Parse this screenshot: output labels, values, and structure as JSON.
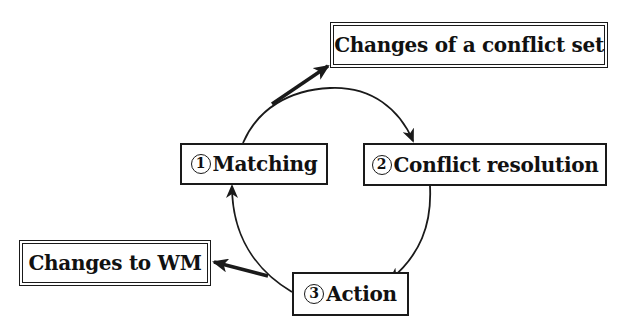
{
  "diagram": {
    "type": "cycle",
    "nodes": [
      {
        "id": "matching",
        "number": "1",
        "label": "Matching",
        "style": "single"
      },
      {
        "id": "conflict_resolution",
        "number": "2",
        "label": "Conflict resolution",
        "style": "single"
      },
      {
        "id": "action",
        "number": "3",
        "label": "Action",
        "style": "single"
      }
    ],
    "outputs": [
      {
        "id": "conflict_set_changes",
        "label": "Changes of a conflict set",
        "style": "double",
        "from": "matching"
      },
      {
        "id": "wm_changes",
        "label": "Changes to WM",
        "style": "double",
        "from": "action"
      }
    ],
    "edges": [
      {
        "from": "matching",
        "to": "conflict_resolution",
        "kind": "cycle-arc"
      },
      {
        "from": "conflict_resolution",
        "to": "action",
        "kind": "cycle-arc"
      },
      {
        "from": "action",
        "to": "matching",
        "kind": "cycle-arc"
      },
      {
        "from": "matching",
        "to": "conflict_set_changes",
        "kind": "bold-arrow"
      },
      {
        "from": "action",
        "to": "wm_changes",
        "kind": "bold-arrow"
      }
    ]
  },
  "labels": {
    "conflict_set_changes": "Changes of a conflict set",
    "matching_num": "1",
    "matching": "Matching",
    "conflict_resolution_num": "2",
    "conflict_resolution": "Conflict resolution",
    "wm_changes": "Changes to WM",
    "action_num": "3",
    "action": "Action"
  },
  "colors": {
    "line": "#1a1a1a",
    "background": "#ffffff"
  }
}
